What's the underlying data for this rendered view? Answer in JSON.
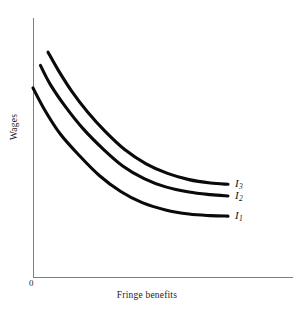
{
  "chart_data": {
    "type": "line",
    "title": "",
    "subtitle": "",
    "xlabel": "Fringe benefits",
    "ylabel": "Wages",
    "origin_label": "0",
    "grid": false,
    "legend_position": "right-of-curve-ends",
    "axis_style": {
      "axis_color": "#7d7d7d",
      "curve_color": "#0a0a0a",
      "background": "#ffffff",
      "ticks": "none",
      "tick_labels": "none"
    },
    "xlim": [
      0,
      1
    ],
    "ylim": [
      0,
      1
    ],
    "annotations": [
      {
        "text": "I3",
        "display": "I",
        "subscript": "3",
        "target_series": "I3"
      },
      {
        "text": "I2",
        "display": "I",
        "subscript": "2",
        "target_series": "I2"
      },
      {
        "text": "I1",
        "display": "I",
        "subscript": "1",
        "target_series": "I1"
      }
    ],
    "series": [
      {
        "name": "I3",
        "label_display": "I",
        "label_subscript": "3",
        "description": "highest indifference curve",
        "x": [
          0.077,
          0.13,
          0.2,
          0.28,
          0.37,
          0.47,
          0.58,
          0.69,
          0.8,
          0.91,
          1.0
        ],
        "y": [
          0.868,
          0.798,
          0.716,
          0.637,
          0.562,
          0.492,
          0.437,
          0.4,
          0.376,
          0.363,
          0.358
        ]
      },
      {
        "name": "I2",
        "label_display": "I",
        "label_subscript": "2",
        "description": "middle indifference curve",
        "x": [
          0.038,
          0.09,
          0.17,
          0.26,
          0.36,
          0.46,
          0.57,
          0.68,
          0.8,
          0.91,
          1.0
        ],
        "y": [
          0.817,
          0.742,
          0.654,
          0.57,
          0.494,
          0.429,
          0.38,
          0.348,
          0.328,
          0.318,
          0.313
        ]
      },
      {
        "name": "I1",
        "label_display": "I",
        "label_subscript": "1",
        "description": "lowest indifference curve",
        "x": [
          0.0,
          0.06,
          0.14,
          0.24,
          0.34,
          0.45,
          0.56,
          0.68,
          0.8,
          0.91,
          1.0
        ],
        "y": [
          0.73,
          0.645,
          0.552,
          0.467,
          0.392,
          0.33,
          0.287,
          0.259,
          0.243,
          0.237,
          0.235
        ]
      }
    ]
  },
  "axes": {
    "y_axis_label": "Wages",
    "x_axis_label": "Fringe benefits",
    "origin": "0"
  }
}
